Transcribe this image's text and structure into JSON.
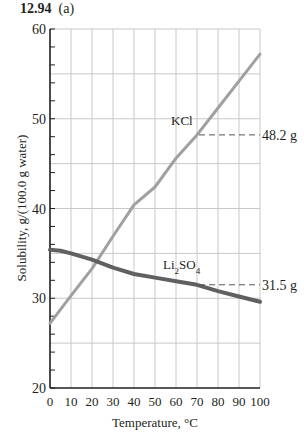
{
  "figure": {
    "number": "12.94",
    "part": "(a)"
  },
  "chart_data": {
    "type": "line",
    "xlabel": "Temperature, °C",
    "ylabel": "Solubility, g/(100.0 g water)",
    "xlim": [
      0,
      100
    ],
    "ylim": [
      20,
      60
    ],
    "x_ticks": [
      0,
      10,
      20,
      30,
      40,
      50,
      60,
      70,
      80,
      90,
      100
    ],
    "y_ticks_labeled": [
      20,
      30,
      40,
      50,
      60
    ],
    "y_minor_step": 2,
    "grid": true,
    "grid_x_step": 10,
    "grid_y_step": 5,
    "series": [
      {
        "name": "KCl",
        "color": "#a0a0a0",
        "x": [
          0,
          10,
          20,
          30,
          40,
          50,
          60,
          70,
          80,
          90,
          100
        ],
        "values": [
          27.2,
          30.3,
          33.3,
          36.9,
          40.4,
          42.4,
          45.6,
          48.2,
          51.2,
          54.2,
          57.2
        ]
      },
      {
        "name": "Li2SO4",
        "color": "#606060",
        "x": [
          0,
          5,
          10,
          20,
          30,
          40,
          50,
          60,
          70,
          80,
          90,
          100
        ],
        "values": [
          35.4,
          35.3,
          35.0,
          34.3,
          33.4,
          32.7,
          32.3,
          31.9,
          31.5,
          30.8,
          30.2,
          29.6
        ]
      }
    ],
    "annotations": [
      {
        "series": "KCl",
        "label": "KCl",
        "x": 70,
        "value": 48.2,
        "text": "48.2 g"
      },
      {
        "series": "Li2SO4",
        "label": "Li₂SO₄",
        "x": 70,
        "value": 31.5,
        "text": "31.5 g"
      }
    ]
  }
}
